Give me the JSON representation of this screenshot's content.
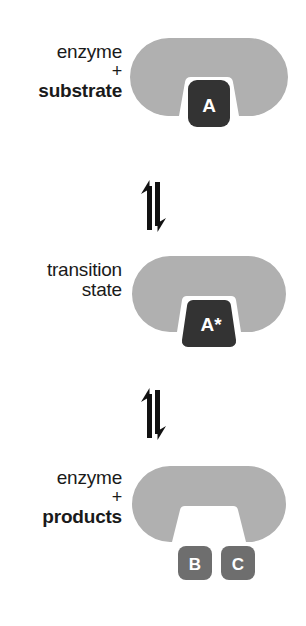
{
  "diagram": {
    "background_color": "#ffffff",
    "enzyme_color": "#b0b0b0",
    "substrate_color": "#333333",
    "product_color": "#6e6e6e",
    "molecule_text_color": "#ffffff",
    "label_color": "#1a1a1a",
    "arrow_color": "#111111"
  },
  "stages": [
    {
      "id": "enzyme-substrate",
      "label_lines": [
        "enzyme",
        "+",
        "substrate"
      ],
      "label_bold": [
        false,
        false,
        true
      ],
      "molecules": [
        {
          "id": "substrate-a",
          "text": "A",
          "shape": "rounded-square",
          "color": "#333333"
        }
      ],
      "cleft": "narrow-notch"
    },
    {
      "id": "transition-state",
      "label_lines": [
        "transition",
        "state"
      ],
      "label_bold": [
        false,
        false
      ],
      "molecules": [
        {
          "id": "transition-a-star",
          "text": "A*",
          "shape": "trapezoid",
          "color": "#333333"
        }
      ],
      "cleft": "trapezoid-cleft"
    },
    {
      "id": "enzyme-products",
      "label_lines": [
        "enzyme",
        "+",
        "products"
      ],
      "label_bold": [
        false,
        false,
        true
      ],
      "molecules": [
        {
          "id": "product-b",
          "text": "B",
          "shape": "rounded-square",
          "color": "#6e6e6e"
        },
        {
          "id": "product-c",
          "text": "C",
          "shape": "rounded-square",
          "color": "#6e6e6e"
        }
      ],
      "cleft": "wide-flared"
    }
  ],
  "arrows": [
    {
      "id": "equilibrium-arrow-1",
      "symbol": "equilibrium-vertical",
      "direction": "up-down"
    },
    {
      "id": "equilibrium-arrow-2",
      "symbol": "equilibrium-vertical",
      "direction": "up-down"
    }
  ]
}
